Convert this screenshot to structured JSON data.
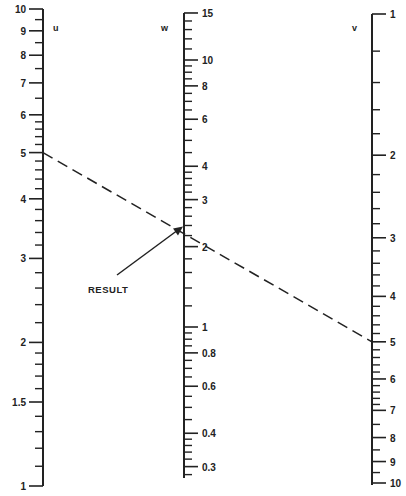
{
  "diagram": {
    "type": "nomogram",
    "scale": "logarithmic",
    "colors": {
      "ink": "#222222",
      "background": "#ffffff"
    },
    "axes": [
      {
        "id": "u",
        "name": "u",
        "x": 43,
        "direction": "up",
        "min": 1,
        "max": 10,
        "labels": [
          "1",
          "1.5",
          "2",
          "3",
          "4",
          "5",
          "6",
          "7",
          "8",
          "9",
          "10"
        ],
        "label_values": [
          1,
          1.5,
          2,
          3,
          4,
          5,
          6,
          7,
          8,
          9,
          10
        ],
        "minor_ticks": [
          1.1,
          1.2,
          1.3,
          1.4,
          1.6,
          1.7,
          1.8,
          1.9,
          2.2,
          2.4,
          2.6,
          2.8,
          3.2,
          3.4,
          3.6,
          3.8,
          4.2,
          4.4,
          4.6,
          4.8,
          5.2,
          5.4,
          5.6,
          5.8,
          6.5,
          7.5,
          8.5,
          9.5
        ]
      },
      {
        "id": "w",
        "name": "w",
        "x": 184,
        "direction": "up",
        "min": 0.28,
        "max": 15,
        "labels": [
          "0.3",
          "0.4",
          "0.6",
          "0.8",
          "1",
          "2",
          "3",
          "4",
          "6",
          "8",
          "10",
          "15"
        ],
        "label_values": [
          0.3,
          0.4,
          0.6,
          0.8,
          1,
          2,
          3,
          4,
          6,
          8,
          10,
          15
        ],
        "minor_ticks": [
          0.28,
          0.32,
          0.34,
          0.36,
          0.38,
          0.45,
          0.5,
          0.55,
          0.65,
          0.7,
          0.75,
          0.85,
          0.9,
          0.95,
          1.2,
          1.4,
          1.6,
          1.8,
          2.2,
          2.4,
          2.6,
          2.8,
          3.2,
          3.4,
          3.6,
          3.8,
          4.5,
          5,
          5.5,
          6.5,
          7,
          7.5,
          8.5,
          9,
          9.5,
          11,
          12,
          13,
          14
        ]
      },
      {
        "id": "v",
        "name": "v",
        "x": 372,
        "direction": "down",
        "min": 1,
        "max": 10,
        "labels": [
          "1",
          "2",
          "3",
          "4",
          "5",
          "6",
          "7",
          "8",
          "9",
          "10"
        ],
        "label_values": [
          1,
          2,
          3,
          4,
          5,
          6,
          7,
          8,
          9,
          10
        ],
        "minor_ticks": [
          1.2,
          1.4,
          1.6,
          1.8,
          2.2,
          2.4,
          2.6,
          2.8,
          3.2,
          3.4,
          3.6,
          3.8,
          4.2,
          4.4,
          4.6,
          4.8,
          5.2,
          5.4,
          5.6,
          5.8,
          6.2,
          6.4,
          6.6,
          6.8,
          7.5,
          8.5,
          9.5
        ]
      }
    ],
    "isopleth": {
      "style": "dashed",
      "from": {
        "axis": "u",
        "value": 5
      },
      "to": {
        "axis": "v",
        "value": 5
      },
      "crosses": {
        "axis": "w",
        "value": 2.4
      }
    },
    "annotation": {
      "text": "RESULT",
      "arrow_to": {
        "axis": "w",
        "value": 2.4
      }
    }
  }
}
